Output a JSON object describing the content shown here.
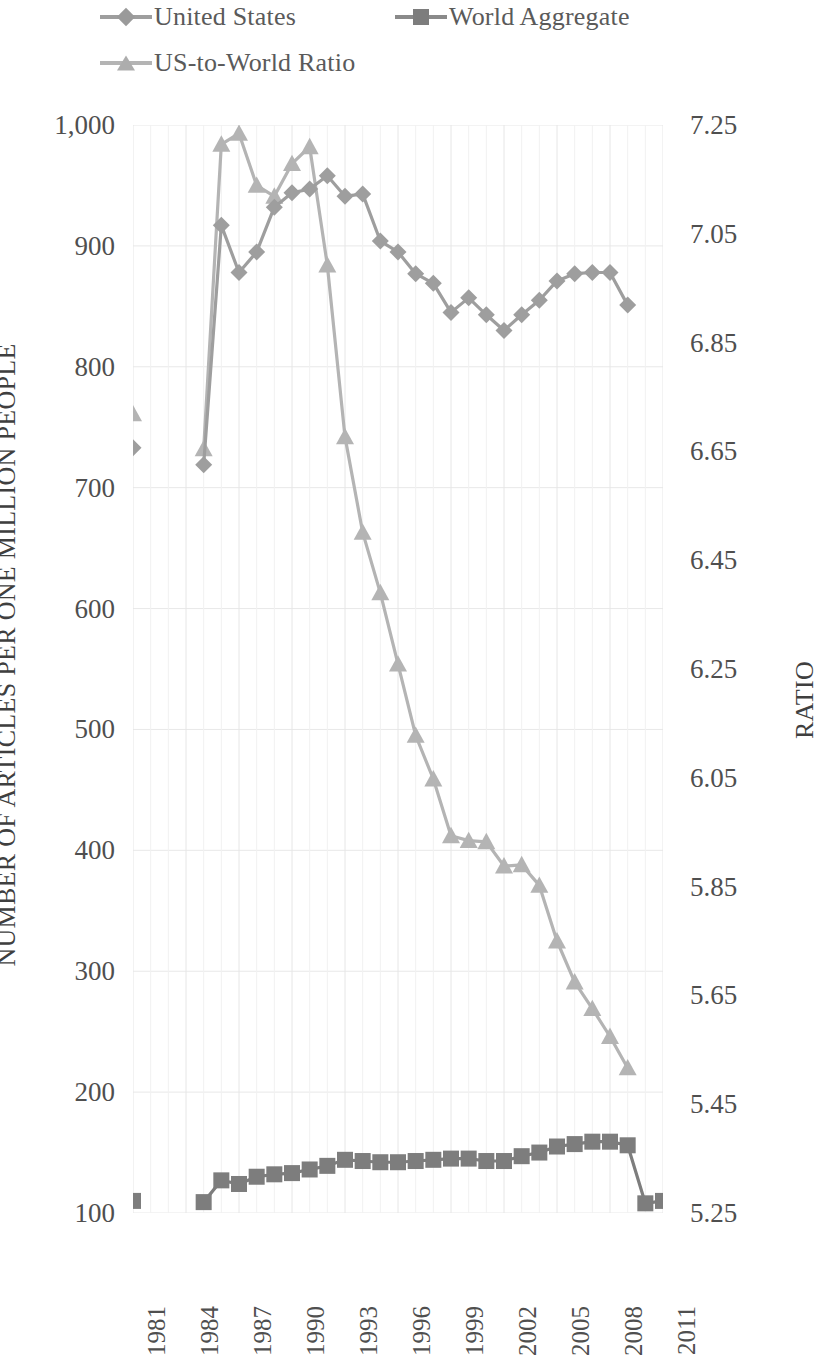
{
  "legend": {
    "items": [
      {
        "label": "United States",
        "marker": "diamond-marker",
        "color": "#9e9e9e"
      },
      {
        "label": "World Aggregate",
        "marker": "square-marker",
        "color": "#7d7d7d"
      },
      {
        "label": "US-to-World Ratio",
        "marker": "triangle-marker",
        "color": "#b4b4b4"
      }
    ]
  },
  "axes": {
    "left_title": "NUMBER OF ARTICLES PER ONE MILLION PEOPLE",
    "right_title": "RATIO",
    "left_ticks": [
      "1,000",
      "900",
      "800",
      "700",
      "600",
      "500",
      "400",
      "300",
      "200",
      "100"
    ],
    "right_ticks": [
      "7.25",
      "7.05",
      "6.85",
      "6.65",
      "6.45",
      "6.25",
      "6.05",
      "5.85",
      "5.65",
      "5.45",
      "5.25"
    ],
    "x_ticks": [
      "1981",
      "1984",
      "1987",
      "1990",
      "1993",
      "1996",
      "1999",
      "2002",
      "2005",
      "2008",
      "2011"
    ]
  },
  "chart_data": {
    "type": "line",
    "title": "",
    "xlabel": "",
    "ylabel": "NUMBER OF ARTICLES PER ONE MILLION PEOPLE",
    "y2label": "RATIO",
    "ylim": [
      100,
      1000
    ],
    "y2lim": [
      5.25,
      7.25
    ],
    "xlim": [
      1981,
      2011
    ],
    "grid": true,
    "legend_position": "top",
    "x": [
      1981,
      1982,
      1983,
      1984,
      1985,
      1986,
      1987,
      1988,
      1989,
      1990,
      1991,
      1992,
      1993,
      1994,
      1995,
      1996,
      1997,
      1998,
      1999,
      2000,
      2001,
      2002,
      2003,
      2004,
      2005,
      2006,
      2007,
      2008,
      2009,
      2010,
      2011
    ],
    "series": [
      {
        "name": "United States",
        "axis": "left",
        "marker": "diamond",
        "color": "#9e9e9e",
        "values": [
          733,
          null,
          null,
          null,
          719,
          917,
          878,
          895,
          932,
          944,
          947,
          958,
          941,
          943,
          904,
          895,
          877,
          869,
          845,
          857,
          843,
          830,
          843,
          855,
          871,
          877,
          878,
          878,
          851,
          null,
          null
        ]
      },
      {
        "name": "World Aggregate",
        "axis": "left",
        "marker": "square",
        "color": "#7d7d7d",
        "values": [
          110,
          null,
          null,
          null,
          109,
          127,
          124,
          130,
          132,
          133,
          136,
          139,
          144,
          143,
          142,
          142,
          143,
          144,
          145,
          145,
          143,
          143,
          147,
          150,
          155,
          157,
          159,
          159,
          156,
          108,
          110
        ]
      },
      {
        "name": "US-to-World Ratio",
        "axis": "right",
        "marker": "triangle",
        "color": "#b4b4b4",
        "values_right_axis": [
          6.66,
          null,
          null,
          null,
          6.65,
          7.22,
          7.25,
          7.14,
          7.12,
          7.18,
          7.23,
          6.97,
          6.68,
          6.55,
          6.38,
          6.25,
          6.13,
          6.04,
          5.93,
          5.92,
          5.92,
          5.89,
          5.89,
          5.86,
          5.83,
          5.72,
          5.66,
          5.61,
          5.48,
          null,
          null
        ],
        "values_plotted_on_left_scale": [
          761,
          null,
          null,
          null,
          732,
          984,
          993,
          950,
          941,
          968,
          982,
          884,
          742,
          663,
          613,
          554,
          495,
          459,
          412,
          408,
          407,
          387,
          388,
          371,
          325,
          291,
          269,
          246,
          220,
          null,
          null
        ]
      }
    ]
  }
}
